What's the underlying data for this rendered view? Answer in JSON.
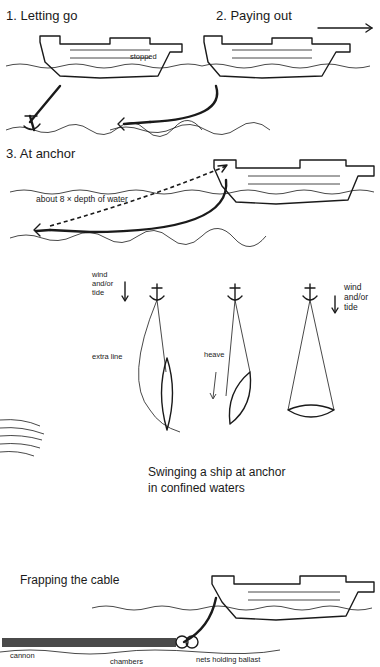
{
  "panels": {
    "letting_go": {
      "title": "1.  Letting go",
      "note": "stopped"
    },
    "paying_out": {
      "title": "2.  Paying out",
      "direction": "right-arrow"
    },
    "at_anchor": {
      "title": "3.  At anchor",
      "scope_note": "about 8 × depth of water"
    },
    "swinging": {
      "wind_label_left": "wind\nand/or\ntide",
      "wind_label_right": "wind\nand/or\ntide",
      "extra_line": "extra line",
      "heave": "heave",
      "caption_line1": "Swinging a ship at anchor",
      "caption_line2": "in confined waters"
    },
    "frapping": {
      "title": "Frapping the cable",
      "cannon": "cannon",
      "chambers": "chambers",
      "nets": "nets holding ballast"
    }
  },
  "colors": {
    "ink": "#1a1a1a",
    "paper": "#ffffff"
  }
}
